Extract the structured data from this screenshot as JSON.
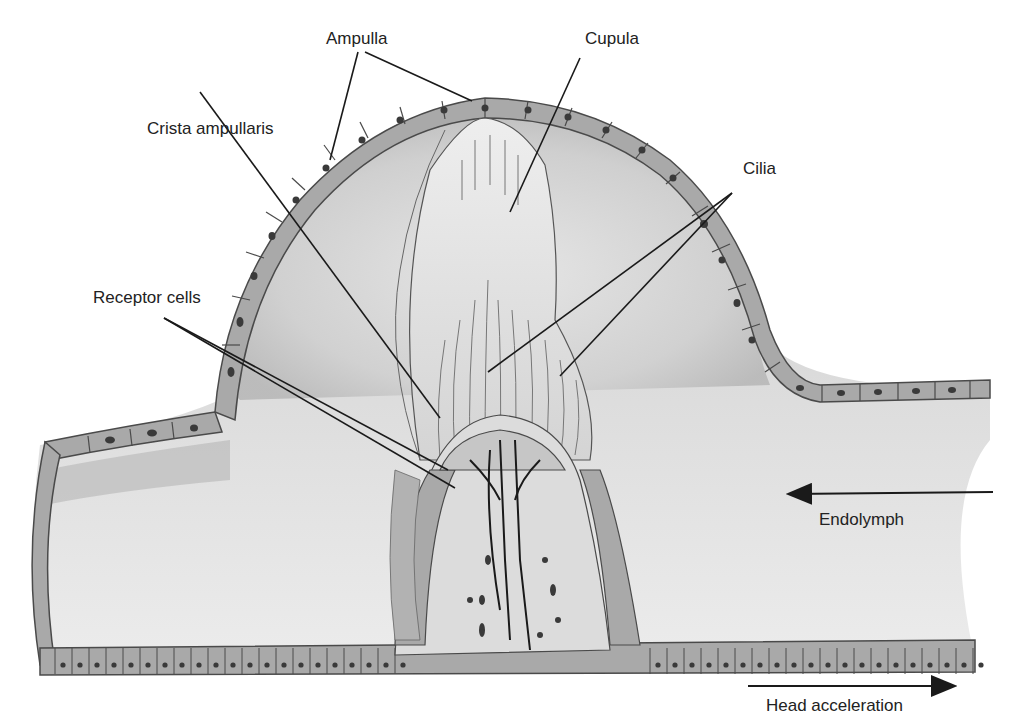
{
  "diagram": {
    "colors": {
      "background": "#ffffff",
      "cell_fill": "#a9a9a9",
      "cell_stroke": "#4a4a4a",
      "nucleus": "#3a3a3a",
      "lumen_light": "#ebebeb",
      "lumen_dark": "#bdbdbd",
      "cupula_fill": "#e6e6e6",
      "leader_line": "#1a1a1a",
      "text": "#222222"
    },
    "labels": {
      "ampulla": "Ampulla",
      "cupula": "Cupula",
      "crista_ampullaris": "Crista ampullaris",
      "cilia": "Cilia",
      "receptor_cells": "Receptor cells",
      "endolymph": "Endolymph",
      "head_acceleration": "Head acceleration"
    },
    "arrows": {
      "endolymph": {
        "direction": "left",
        "from": [
          993,
          492
        ],
        "to": [
          788,
          494
        ]
      },
      "head_acceleration": {
        "direction": "right",
        "from": [
          748,
          686
        ],
        "to": [
          955,
          686
        ]
      }
    }
  }
}
